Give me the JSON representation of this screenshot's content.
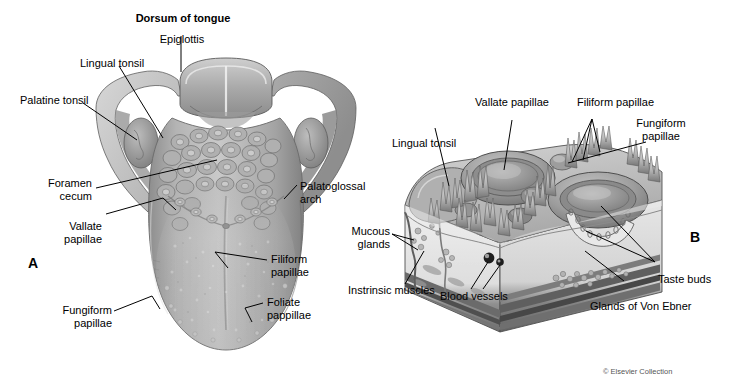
{
  "figure": {
    "title_label": "Dorsum of tongue",
    "credit": "© Elsevier Collection",
    "panel_a_letter": "A",
    "panel_b_letter": "B",
    "background_color": "#ffffff",
    "ink_color": "#000000",
    "illustration_style": "grayscale medical illustration"
  },
  "panel_a": {
    "caption": "Dorsum of tongue, superior view",
    "labels": [
      {
        "id": "dorsum-of-tongue",
        "text": "Dorsum of tongue",
        "bold": true
      },
      {
        "id": "epiglottis",
        "text": "Epiglottis",
        "bold": false
      },
      {
        "id": "lingual-tonsil",
        "text": "Lingual tonsil",
        "bold": false
      },
      {
        "id": "palatine-tonsil",
        "text": "Palatine tonsil",
        "bold": false
      },
      {
        "id": "foramen-cecum",
        "text": "Foramen\ncecum",
        "bold": false
      },
      {
        "id": "vallate-papillae",
        "text": "Vallate\npapillae",
        "bold": false
      },
      {
        "id": "palatoglossal-arch",
        "text": "Palatoglossal\narch",
        "bold": false
      },
      {
        "id": "filiform-papillae",
        "text": "Filiform\npapillae",
        "bold": false
      },
      {
        "id": "fungiform-papillae",
        "text": "Fungiform\npapillae",
        "bold": false
      },
      {
        "id": "foliate-pappillae",
        "text": "Foliate\npappillae",
        "bold": false
      }
    ]
  },
  "panel_b": {
    "caption": "Three-dimensional block section of tongue mucosa",
    "labels": [
      {
        "id": "vallate-papillae",
        "text": "Vallate papillae",
        "bold": false
      },
      {
        "id": "filiform-papillae",
        "text": "Filiform papillae",
        "bold": false
      },
      {
        "id": "fungiform-papillae",
        "text": "Fungiform\npapillae",
        "bold": false
      },
      {
        "id": "lingual-tonsil",
        "text": "Lingual tonsil",
        "bold": false
      },
      {
        "id": "mucous-glands",
        "text": "Mucous\nglands",
        "bold": false
      },
      {
        "id": "instrinsic-muscles",
        "text": "Instrinsic muscles",
        "bold": false
      },
      {
        "id": "blood-vessels",
        "text": "Blood vessels",
        "bold": false
      },
      {
        "id": "taste-buds",
        "text": "Taste buds",
        "bold": false
      },
      {
        "id": "glands-of-von-ebner",
        "text": "Glands of Von Ebner",
        "bold": false
      }
    ]
  }
}
